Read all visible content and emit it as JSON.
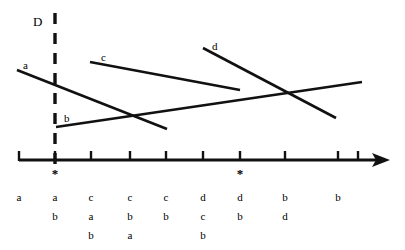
{
  "figure": {
    "title_label": "D",
    "colors": {
      "stroke": "#111111",
      "background": "#ffffff"
    },
    "dashed_line": {
      "label": "D",
      "x": 55,
      "y_top": 13,
      "y_bottom": 166
    },
    "axis": {
      "x_start": 19,
      "x_end": 390,
      "y": 160,
      "arrow": true,
      "ticks": [
        19,
        55,
        91,
        130,
        166,
        203,
        240,
        285,
        338,
        358
      ],
      "markers": [
        {
          "symbol": "*",
          "x": 55
        },
        {
          "symbol": "*",
          "x": 240
        }
      ]
    },
    "lines": [
      {
        "name": "a",
        "label": "a",
        "x1": 17,
        "y1": 70,
        "x2": 167,
        "y2": 129,
        "label_x": 23,
        "label_y": 60
      },
      {
        "name": "b",
        "label": "b",
        "x1": 56,
        "y1": 127,
        "x2": 362,
        "y2": 82,
        "label_x": 64,
        "label_y": 113
      },
      {
        "name": "c",
        "label": "c",
        "x1": 90,
        "y1": 62,
        "x2": 240,
        "y2": 90,
        "label_x": 101,
        "label_y": 52
      },
      {
        "name": "d",
        "label": "d",
        "x1": 203,
        "y1": 48,
        "x2": 336,
        "y2": 118,
        "label_x": 212,
        "label_y": 41
      }
    ]
  },
  "chart_data": {
    "type": "line",
    "title": "",
    "xlabel": "",
    "ylabel": "",
    "annotations": [
      "D",
      "*",
      "*"
    ],
    "columns": [
      {
        "x": 19,
        "items": [
          "a"
        ]
      },
      {
        "x": 55,
        "items": [
          "a",
          "b"
        ]
      },
      {
        "x": 91,
        "items": [
          "c",
          "a",
          "b"
        ]
      },
      {
        "x": 130,
        "items": [
          "c",
          "b",
          "a"
        ]
      },
      {
        "x": 166,
        "items": [
          "c",
          "b"
        ]
      },
      {
        "x": 203,
        "items": [
          "d",
          "c",
          "b"
        ]
      },
      {
        "x": 240,
        "items": [
          "d",
          "b"
        ]
      },
      {
        "x": 285,
        "items": [
          "b",
          "d"
        ]
      },
      {
        "x": 338,
        "items": [
          "b"
        ]
      }
    ],
    "series": [
      {
        "name": "a",
        "x": [
          17,
          167
        ],
        "y": [
          70,
          129
        ]
      },
      {
        "name": "b",
        "x": [
          56,
          362
        ],
        "y": [
          127,
          82
        ]
      },
      {
        "name": "c",
        "x": [
          90,
          240
        ],
        "y": [
          62,
          90
        ]
      },
      {
        "name": "d",
        "x": [
          203,
          336
        ],
        "y": [
          48,
          118
        ]
      }
    ]
  }
}
